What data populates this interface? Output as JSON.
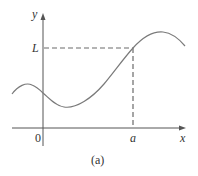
{
  "figure": {
    "caption": "(a)",
    "axes": {
      "x_label": "x",
      "y_label": "y",
      "origin_label": "0"
    },
    "markers": {
      "x_marker_label": "a",
      "y_marker_label": "L"
    },
    "colors": {
      "axis": "#555555",
      "curve": "#7a7a7a",
      "dashed": "#6a6a6a",
      "text": "#333333"
    },
    "curve_description": "smooth curve with local max left of y-axis, local min right of origin, rising through point (a, L), peaking then falling"
  }
}
